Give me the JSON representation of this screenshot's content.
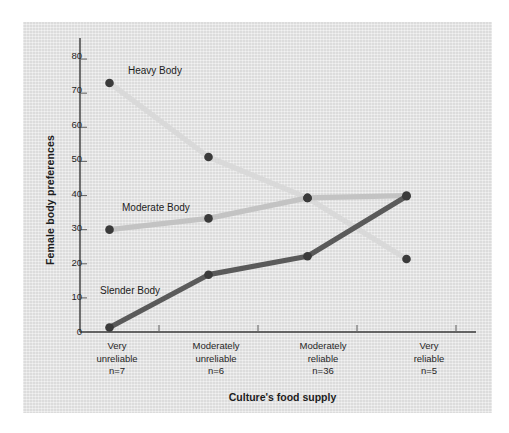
{
  "figure": {
    "background_color": "#ffffff",
    "panel_color": "#e2e2e2"
  },
  "chart_data": {
    "type": "line",
    "title": "",
    "xlabel": "Culture's food supply",
    "ylabel": "Female body preferences",
    "categories": [
      "Very unreliable n=7",
      "Moderately unreliable n=6",
      "Moderately reliable n=36",
      "Very reliable n=5"
    ],
    "category_lines": [
      [
        "Very",
        "unreliable",
        "n=7"
      ],
      [
        "Moderately",
        "unreliable",
        "n=6"
      ],
      [
        "Moderately",
        "reliable",
        "n=36"
      ],
      [
        "Very",
        "reliable",
        "n=5"
      ]
    ],
    "x": [
      1,
      2,
      3,
      4
    ],
    "ylim": [
      0,
      85
    ],
    "yticks": [
      0,
      10,
      20,
      30,
      40,
      50,
      60,
      70,
      80
    ],
    "ytick_labels": [
      "0",
      "10",
      "20",
      "30",
      "40",
      "50",
      "60",
      "70",
      "80"
    ],
    "grid": false,
    "legend": "inline-annotations",
    "series": [
      {
        "name": "Heavy Body",
        "color": "#d9d9d9",
        "marker_color": "#3a3a3a",
        "values": [
          73.0,
          51.3,
          39.3,
          21.4
        ],
        "label_x": 2,
        "label_y": 75
      },
      {
        "name": "Moderate Body",
        "color": "#c3c3c3",
        "marker_color": "#3a3a3a",
        "values": [
          30.0,
          33.3,
          39.3,
          40.0
        ],
        "label_x": 1,
        "label_y": 37
      },
      {
        "name": "Slender Body",
        "color": "#5a5a5a",
        "marker_color": "#3a3a3a",
        "values": [
          1.3,
          16.8,
          22.2,
          39.8
        ],
        "label_x": 1,
        "label_y": 11
      }
    ]
  },
  "axes": {
    "yaxis_line_color": "#3a3a3a",
    "xaxis_line_color": "#3a3a3a",
    "tick_color": "#6a6a6a"
  }
}
